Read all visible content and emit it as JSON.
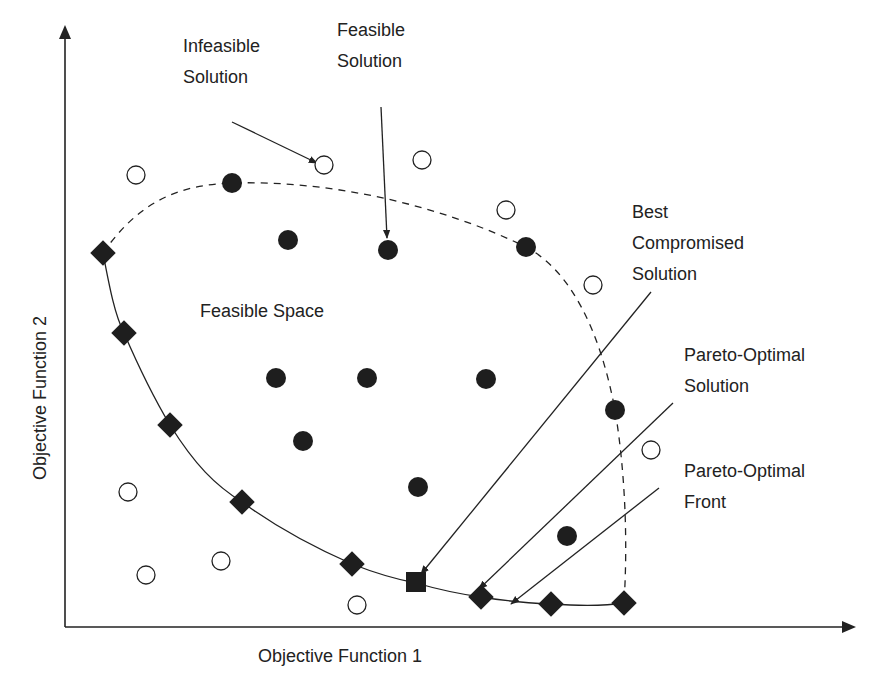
{
  "diagram": {
    "type": "pareto-front-concept",
    "colors": {
      "ink": "#222222",
      "fill": "#1e1e1e",
      "background": "#ffffff"
    },
    "axes": {
      "origin": [
        65,
        627
      ],
      "y_top": [
        65,
        25
      ],
      "x_right": [
        856,
        627
      ],
      "x_label": {
        "text": "Objective Function 1",
        "x": 340,
        "y": 662
      },
      "y_label": {
        "text": "Objective Function 2",
        "x": 46,
        "y": 398
      }
    },
    "feasible_boundary_dashed": "M 103 253 C 140 200, 180 185, 232 183 C 330 180, 440 205, 526 247 C 570 270, 600 330, 615 410 C 625 470, 628 540, 624 603",
    "pareto_front_curve": "M 103 253 C 110 290, 115 315, 124 333 C 140 370, 155 400, 170 425 C 195 465, 215 485, 242 502 C 280 530, 320 550, 352 564 C 380 575, 400 580, 416 583 C 440 590, 460 594, 481 597 C 510 602, 530 603, 551 604 C 580 606, 605 606, 624 603"
  },
  "chart_data": {
    "type": "scatter",
    "title": "",
    "xlabel": "Objective Function 1",
    "ylabel": "Objective Function 2",
    "series": [
      {
        "name": "Infeasible Solution",
        "marker": "open-circle",
        "points": [
          [
            136,
            175
          ],
          [
            324,
            165
          ],
          [
            422,
            160
          ],
          [
            506,
            210
          ],
          [
            593,
            285
          ],
          [
            651,
            450
          ],
          [
            128,
            492
          ],
          [
            146,
            575
          ],
          [
            221,
            561
          ],
          [
            357,
            605
          ]
        ]
      },
      {
        "name": "Feasible Solution",
        "marker": "filled-circle",
        "points": [
          [
            232,
            183
          ],
          [
            288,
            240
          ],
          [
            388,
            250
          ],
          [
            526,
            247
          ],
          [
            276,
            378
          ],
          [
            367,
            378
          ],
          [
            486,
            379
          ],
          [
            615,
            410
          ],
          [
            303,
            441
          ],
          [
            418,
            487
          ],
          [
            567,
            536
          ]
        ]
      },
      {
        "name": "Pareto-Optimal Solution",
        "marker": "filled-diamond",
        "points": [
          [
            103,
            253
          ],
          [
            124,
            333
          ],
          [
            170,
            425
          ],
          [
            242,
            502
          ],
          [
            352,
            564
          ],
          [
            481,
            597
          ],
          [
            551,
            604
          ],
          [
            624,
            603
          ]
        ]
      },
      {
        "name": "Best Compromised Solution",
        "marker": "filled-square",
        "points": [
          [
            416,
            582
          ]
        ]
      }
    ],
    "annotations": [
      {
        "lines": [
          "Infeasible",
          "Solution"
        ],
        "x": 183,
        "y": 52
      },
      {
        "lines": [
          "Feasible",
          "Solution"
        ],
        "x": 337,
        "y": 36
      },
      {
        "lines": [
          "Feasible Space"
        ],
        "x": 200,
        "y": 317
      },
      {
        "lines": [
          "Best",
          "Compromised",
          "Solution"
        ],
        "x": 632,
        "y": 218
      },
      {
        "lines": [
          "Pareto-Optimal",
          "Solution"
        ],
        "x": 684,
        "y": 361
      },
      {
        "lines": [
          "Pareto-Optimal",
          "Front"
        ],
        "x": 684,
        "y": 477
      }
    ],
    "arrows": [
      {
        "label": "Infeasible Solution",
        "from": [
          232,
          122
        ],
        "to": [
          317,
          163
        ]
      },
      {
        "label": "Feasible Solution",
        "from": [
          381,
          107
        ],
        "to": [
          387,
          238
        ]
      },
      {
        "label": "Best Compromised Solution",
        "from": [
          651,
          292
        ],
        "to": [
          421,
          574
        ]
      },
      {
        "label": "Pareto-Optimal Solution",
        "from": [
          673,
          403
        ],
        "to": [
          479,
          589
        ]
      },
      {
        "label": "Pareto-Optimal Front",
        "from": [
          659,
          488
        ],
        "to": [
          511,
          604
        ]
      }
    ]
  }
}
